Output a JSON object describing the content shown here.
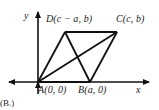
{
  "figure": {
    "type": "coordinate-geometry-diagram",
    "colors": {
      "background": "#ffffff",
      "stroke": "#111111",
      "text": "#1a1a1a"
    },
    "axes": {
      "x_label": "x",
      "y_label": "y",
      "origin_px": [
        38,
        82
      ],
      "x_axis_px": {
        "x1": 5,
        "y1": 82,
        "x2": 153,
        "y2": 82
      },
      "y_axis_px": {
        "x1": 38,
        "y1": 82,
        "x2": 38,
        "y2": 8
      },
      "arrowheads": [
        "x-positive",
        "x-negative",
        "y-positive",
        "y-negative"
      ]
    },
    "vertices": [
      {
        "id": "A",
        "label": "A(0, 0)",
        "px": [
          38,
          82
        ],
        "label_px": [
          38,
          85
        ],
        "coords": "(0, 0)"
      },
      {
        "id": "B",
        "label": "B(a, 0)",
        "px": [
          90,
          82
        ],
        "label_px": [
          78,
          85
        ],
        "coords": "(a, 0)"
      },
      {
        "id": "C",
        "label": "C(c, b)",
        "px": [
          117,
          32
        ],
        "label_px": [
          116,
          14
        ],
        "coords": "(c, b)"
      },
      {
        "id": "D",
        "label": "D(c − a, b)",
        "px": [
          65,
          32
        ],
        "label_px": [
          46,
          14
        ],
        "coords": "(c − a, b)"
      }
    ],
    "edges": [
      {
        "name": "AD",
        "from": "A",
        "to": "D",
        "kind": "side"
      },
      {
        "name": "DC",
        "from": "D",
        "to": "C",
        "kind": "side"
      },
      {
        "name": "CB",
        "from": "C",
        "to": "B",
        "kind": "side"
      },
      {
        "name": "BA",
        "from": "B",
        "to": "A",
        "kind": "side"
      },
      {
        "name": "AC",
        "from": "A",
        "to": "C",
        "kind": "diagonal"
      },
      {
        "name": "DB",
        "from": "D",
        "to": "B",
        "kind": "diagonal"
      }
    ],
    "partial_text_bottom": "(B.)"
  }
}
